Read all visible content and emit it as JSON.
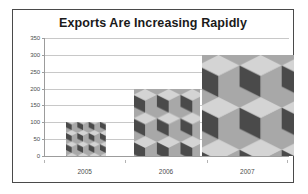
{
  "chart_data": {
    "type": "bar",
    "title": "Exports Are Increasing Rapidly",
    "xlabel": "",
    "ylabel": "",
    "categories": [
      "2005",
      "2006",
      "2007"
    ],
    "values": [
      100,
      200,
      300
    ],
    "ylim": [
      0,
      350
    ],
    "yticks": [
      0,
      50,
      100,
      150,
      200,
      250,
      300,
      350
    ],
    "ytick_labels": [
      "0",
      "50",
      "100",
      "150",
      "200",
      "250",
      "300",
      "350"
    ],
    "grid": true,
    "legend": false,
    "legend_position": "none",
    "bar_fill": "picture-fill-grayscale-isometric-blocks",
    "colors": {
      "title_text": "#1a1a1a",
      "tick_text": "#4d4d4d",
      "gridline": "#c8c8c8",
      "axis_line": "#9c9c9c",
      "plot_background": "#ffffff",
      "frame_border": "#4a4a4a",
      "bar_fill_light": "#d4d4d4",
      "bar_fill_mid": "#a8a8a8",
      "bar_fill_dark": "#4a4a4a"
    }
  }
}
